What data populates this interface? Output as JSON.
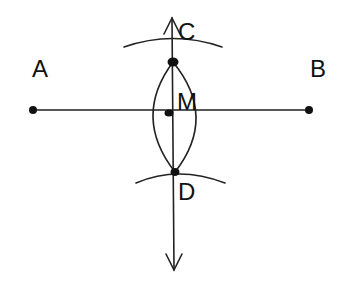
{
  "diagram": {
    "colors": {
      "line": "#222222",
      "point": "#111111",
      "background": "#ffffff"
    },
    "points": [
      {
        "id": "A",
        "label": "A",
        "x": 33,
        "y": 110,
        "label_x": 32,
        "label_y": 77
      },
      {
        "id": "B",
        "label": "B",
        "x": 309,
        "y": 110,
        "label_x": 310,
        "label_y": 77
      },
      {
        "id": "C",
        "label": "C",
        "x": 173,
        "y": 62,
        "label_x": 178,
        "label_y": 40
      },
      {
        "id": "M",
        "label": "M",
        "x": 169,
        "y": 113,
        "label_x": 177,
        "label_y": 110
      },
      {
        "id": "D",
        "label": "D",
        "x": 175,
        "y": 172,
        "label_x": 178,
        "label_y": 200
      }
    ],
    "segments": [
      {
        "id": "AB",
        "from": "A",
        "to": "B"
      }
    ],
    "lines": [
      {
        "id": "CD",
        "description": "perpendicular bisector with arrows at both ends",
        "x": 172,
        "y_top": 18,
        "y_bottom": 270
      }
    ],
    "arcs": [
      {
        "id": "upper-arc",
        "description": "arc intersecting at C"
      },
      {
        "id": "lower-arc",
        "description": "arc intersecting at D"
      },
      {
        "id": "left-lens-arc",
        "description": "left arc of lens between C and D"
      },
      {
        "id": "right-lens-arc",
        "description": "right arc of lens between C and D"
      }
    ]
  }
}
